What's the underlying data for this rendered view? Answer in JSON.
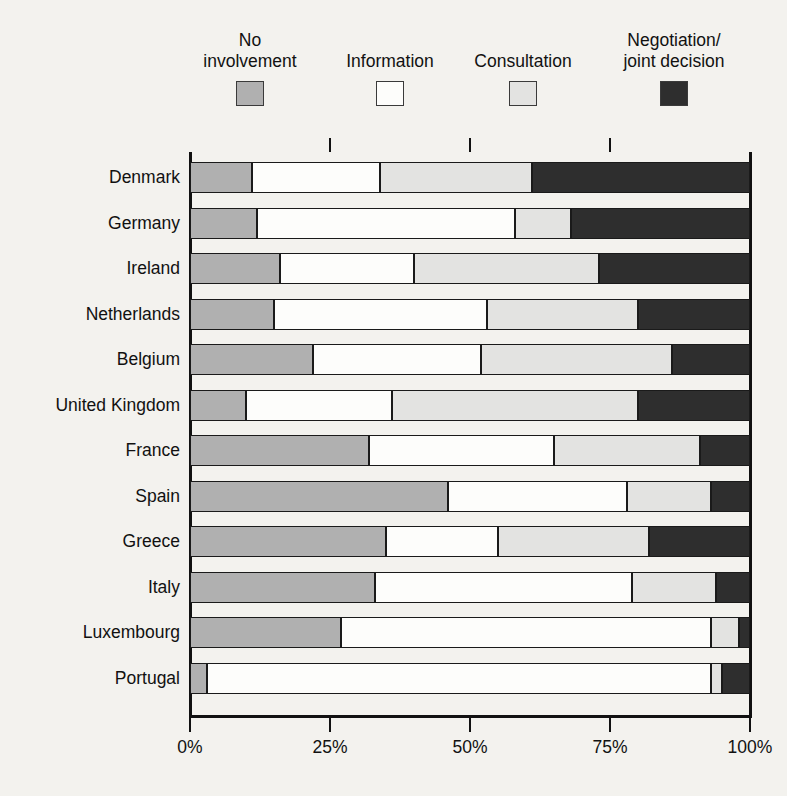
{
  "chart_data": {
    "type": "bar",
    "orientation": "horizontal",
    "stacked": true,
    "normalized": true,
    "title": "",
    "xlabel": "",
    "ylabel": "",
    "xlim": [
      0,
      100
    ],
    "grid": false,
    "legend_position": "top",
    "categories": [
      "Denmark",
      "Germany",
      "Ireland",
      "Netherlands",
      "Belgium",
      "United Kingdom",
      "France",
      "Spain",
      "Greece",
      "Italy",
      "Luxembourg",
      "Portugal"
    ],
    "series": [
      {
        "name": "No involvement",
        "color": "#b0b0b0",
        "values": [
          11,
          12,
          16,
          15,
          22,
          10,
          32,
          46,
          35,
          33,
          27,
          3
        ]
      },
      {
        "name": "Information",
        "color": "#fdfdfb",
        "values": [
          23,
          46,
          24,
          38,
          30,
          26,
          33,
          32,
          20,
          46,
          66,
          90
        ]
      },
      {
        "name": "Consultation",
        "color": "#e3e3e1",
        "values": [
          27,
          10,
          33,
          27,
          34,
          44,
          26,
          15,
          27,
          15,
          5,
          2
        ]
      },
      {
        "name": "Negotiation/joint decision",
        "color": "#2e2e2e",
        "values": [
          39,
          32,
          27,
          20,
          14,
          20,
          9,
          7,
          18,
          6,
          2,
          5
        ]
      }
    ],
    "x_ticks": [
      0,
      25,
      50,
      75,
      100
    ],
    "x_tick_labels": [
      "0%",
      "25%",
      "50%",
      "75%",
      "100%"
    ]
  },
  "legend": {
    "items": [
      {
        "label": "No\ninvolvement",
        "swatch": "swatch-no-involvement"
      },
      {
        "label": "Information",
        "swatch": "swatch-information"
      },
      {
        "label": "Consultation",
        "swatch": "swatch-consultation"
      },
      {
        "label": "Negotiation/\njoint decision",
        "swatch": "swatch-negotiation"
      }
    ]
  },
  "colors": {
    "background": "#f3f2ee",
    "axis": "#111111",
    "no_involvement": "#b0b0b0",
    "information": "#fdfdfb",
    "consultation": "#e3e3e1",
    "negotiation": "#2e2e2e"
  }
}
